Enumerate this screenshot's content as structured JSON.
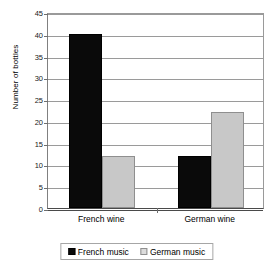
{
  "chart_data": {
    "type": "bar",
    "title": "",
    "subtitle": "",
    "xlabel": "",
    "ylabel": "Number of bottles",
    "categories": [
      "French wine",
      "German wine"
    ],
    "series": [
      {
        "name": "French music",
        "values": [
          40,
          12
        ],
        "color": "#000000"
      },
      {
        "name": "German music",
        "values": [
          12,
          22
        ],
        "color": "#c8c8c8"
      }
    ],
    "ylim": [
      0,
      45
    ],
    "ytick_step": 5,
    "yticks": [
      0,
      5,
      10,
      15,
      20,
      25,
      30,
      35,
      40,
      45
    ],
    "ytick_labels": [
      "0",
      "5",
      "10",
      "15",
      "20",
      "25",
      "30",
      "35",
      "40",
      "45"
    ],
    "grid": true,
    "grid_axis": "y",
    "legend_position": "bottom",
    "annotations": [],
    "data_points": [
      {
        "category": "French wine",
        "series": "French music",
        "value": 40
      },
      {
        "category": "French wine",
        "series": "German music",
        "value": 12
      },
      {
        "category": "German wine",
        "series": "French music",
        "value": 8
      },
      {
        "category": "German wine",
        "series": "German music",
        "value": 22
      }
    ]
  },
  "legend": {
    "items": [
      {
        "label": "French music",
        "swatch": "black-square-swatch"
      },
      {
        "label": "German music",
        "swatch": "light-gray-square-swatch"
      }
    ]
  },
  "colors": {
    "series_french_music": "#000000",
    "series_german_music": "#c8c8c8",
    "gridline": "#9a9a9a",
    "axis": "#4a4a4a",
    "background": "#ffffff",
    "text": "#000000"
  }
}
